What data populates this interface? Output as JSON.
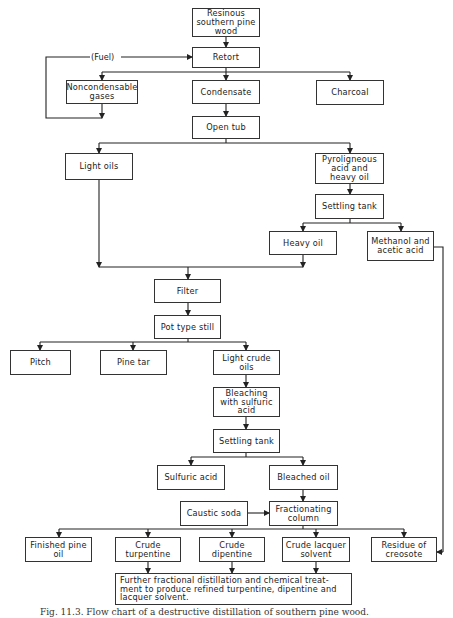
{
  "diagram": {
    "type": "flowchart",
    "nodes": {
      "pine_wood": "Resinous southern pine wood",
      "retort": "Retort",
      "noncondensable": "Noncondensable gases",
      "condensate": "Condensate",
      "charcoal": "Charcoal",
      "open_tub": "Open tub",
      "light_oils": "Light oils",
      "pyroligneous": "Pyroligneous acid and heavy oil",
      "settling_tank_1": "Settling tank",
      "heavy_oil": "Heavy oil",
      "methanol": "Methanol and acetic acid",
      "filter": "Filter",
      "pot_still": "Pot type still",
      "pitch": "Pitch",
      "pine_tar": "Pine tar",
      "light_crude": "Light crude oils",
      "bleaching": "Bleaching with sulfuric acid",
      "settling_tank_2": "Settling tank",
      "sulfuric_acid": "Sulfuric acid",
      "bleached_oil": "Bleached oil",
      "caustic_soda": "Caustic soda",
      "fractionating": "Fractionating column",
      "finished_pine_oil": "Finished pine oil",
      "crude_turpentine": "Crude turpentine",
      "crude_dipentine": "Crude dipentine",
      "crude_lacquer": "Crude lacquer solvent",
      "residue_creosote": "Residue of creosote",
      "further": "Further fractional distillation and chemical treat- ment to produce refined turpentine, dipentine and lacquer solvent."
    },
    "edge_labels": {
      "fuel": "(Fuel)"
    },
    "edges": [
      [
        "pine_wood",
        "retort"
      ],
      [
        "retort",
        "noncondensable"
      ],
      [
        "retort",
        "condensate"
      ],
      [
        "retort",
        "charcoal"
      ],
      [
        "noncondensable",
        "retort",
        "(Fuel)"
      ],
      [
        "condensate",
        "open_tub"
      ],
      [
        "open_tub",
        "light_oils"
      ],
      [
        "open_tub",
        "pyroligneous"
      ],
      [
        "pyroligneous",
        "settling_tank_1"
      ],
      [
        "settling_tank_1",
        "heavy_oil"
      ],
      [
        "settling_tank_1",
        "methanol"
      ],
      [
        "light_oils",
        "filter"
      ],
      [
        "heavy_oil",
        "filter"
      ],
      [
        "methanol",
        "residue_creosote"
      ],
      [
        "filter",
        "pot_still"
      ],
      [
        "pot_still",
        "pitch"
      ],
      [
        "pot_still",
        "pine_tar"
      ],
      [
        "pot_still",
        "light_crude"
      ],
      [
        "light_crude",
        "bleaching"
      ],
      [
        "bleaching",
        "settling_tank_2"
      ],
      [
        "settling_tank_2",
        "sulfuric_acid"
      ],
      [
        "settling_tank_2",
        "bleached_oil"
      ],
      [
        "bleached_oil",
        "fractionating"
      ],
      [
        "caustic_soda",
        "fractionating"
      ],
      [
        "fractionating",
        "finished_pine_oil"
      ],
      [
        "fractionating",
        "crude_turpentine"
      ],
      [
        "fractionating",
        "crude_dipentine"
      ],
      [
        "fractionating",
        "crude_lacquer"
      ],
      [
        "fractionating",
        "residue_creosote"
      ],
      [
        "crude_turpentine",
        "further"
      ],
      [
        "crude_dipentine",
        "further"
      ],
      [
        "crude_lacquer",
        "further"
      ]
    ]
  },
  "caption": "Fig. 11.3. Flow chart of a destructive distillation of southern pine wood."
}
